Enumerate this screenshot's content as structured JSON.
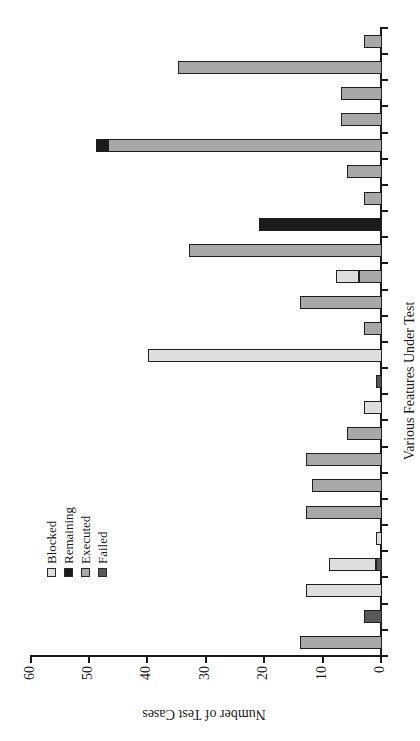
{
  "chart_data": {
    "type": "bar",
    "stacked": true,
    "rotation": "entire chart rotated 90 degrees counter-clockwise",
    "title": "",
    "xlabel": "Various Features Under Test",
    "ylabel": "Number of Test Cases",
    "ylim": [
      0,
      60
    ],
    "yticks": [
      0,
      10,
      20,
      30,
      40,
      50,
      60
    ],
    "x_tick_labels_visible": false,
    "num_categories": 24,
    "grid": false,
    "legend": {
      "position": "top-left inside plot area",
      "entries": [
        {
          "name": "Blocked",
          "color": "#dedede"
        },
        {
          "name": "Remaining",
          "color": "#1b1b1b"
        },
        {
          "name": "Executed",
          "color": "#a8a8a8"
        },
        {
          "name": "Failed",
          "color": "#585858"
        }
      ]
    },
    "bars": [
      {
        "category_index": 1,
        "segments": [
          {
            "series": "Executed",
            "value": 14
          }
        ]
      },
      {
        "category_index": 2,
        "segments": [
          {
            "series": "Failed",
            "value": 3
          }
        ]
      },
      {
        "category_index": 3,
        "segments": [
          {
            "series": "Blocked",
            "value": 13
          }
        ]
      },
      {
        "category_index": 4,
        "segments": [
          {
            "series": "Failed",
            "value": 1
          },
          {
            "series": "Blocked",
            "value": 8
          }
        ]
      },
      {
        "category_index": 5,
        "segments": [
          {
            "series": "Blocked",
            "value": 1
          }
        ]
      },
      {
        "category_index": 6,
        "segments": [
          {
            "series": "Executed",
            "value": 13
          }
        ]
      },
      {
        "category_index": 7,
        "segments": [
          {
            "series": "Executed",
            "value": 12
          }
        ]
      },
      {
        "category_index": 8,
        "segments": [
          {
            "series": "Executed",
            "value": 13
          }
        ]
      },
      {
        "category_index": 9,
        "segments": [
          {
            "series": "Executed",
            "value": 6
          }
        ]
      },
      {
        "category_index": 10,
        "segments": [
          {
            "series": "Blocked",
            "value": 3
          }
        ]
      },
      {
        "category_index": 11,
        "segments": [
          {
            "series": "Failed",
            "value": 1
          }
        ]
      },
      {
        "category_index": 12,
        "segments": [
          {
            "series": "Blocked",
            "value": 40
          }
        ]
      },
      {
        "category_index": 13,
        "segments": [
          {
            "series": "Executed",
            "value": 3
          }
        ]
      },
      {
        "category_index": 14,
        "segments": [
          {
            "series": "Executed",
            "value": 14
          }
        ]
      },
      {
        "category_index": 15,
        "segments": [
          {
            "series": "Executed",
            "value": 4
          },
          {
            "series": "Blocked",
            "value": 4
          }
        ]
      },
      {
        "category_index": 16,
        "segments": [
          {
            "series": "Executed",
            "value": 33
          }
        ]
      },
      {
        "category_index": 17,
        "segments": [
          {
            "series": "Remaining",
            "value": 21
          }
        ]
      },
      {
        "category_index": 18,
        "segments": [
          {
            "series": "Executed",
            "value": 3
          }
        ]
      },
      {
        "category_index": 19,
        "segments": [
          {
            "series": "Executed",
            "value": 6
          }
        ]
      },
      {
        "category_index": 20,
        "segments": [
          {
            "series": "Executed",
            "value": 47
          },
          {
            "series": "Remaining",
            "value": 2
          }
        ]
      },
      {
        "category_index": 21,
        "segments": [
          {
            "series": "Executed",
            "value": 7
          }
        ]
      },
      {
        "category_index": 22,
        "segments": [
          {
            "series": "Executed",
            "value": 7
          }
        ]
      },
      {
        "category_index": 23,
        "segments": [
          {
            "series": "Executed",
            "value": 35
          }
        ]
      },
      {
        "category_index": 24,
        "segments": [
          {
            "series": "Executed",
            "value": 3
          }
        ]
      }
    ],
    "colors": {
      "axis": "#1a1a1a",
      "text": "#1a1a1a",
      "background": "#ffffff"
    }
  }
}
